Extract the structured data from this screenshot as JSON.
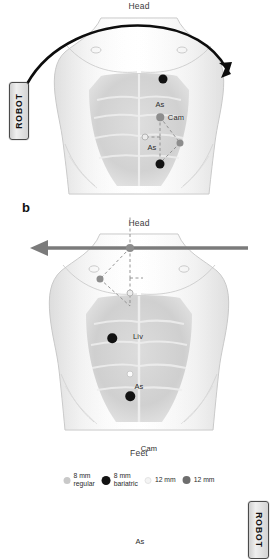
{
  "figure": {
    "panels": [
      {
        "id": "a",
        "letter": "",
        "orientation_top": "Head",
        "robot_label": "ROBOT",
        "robot_side": "left",
        "arrow": "curved-arrow-down-right",
        "ports": [
          {
            "name": "assistant-upper-right",
            "label": "",
            "type": "8 mm bariatric",
            "color": "#121212"
          },
          {
            "name": "arm-upper",
            "label": "As",
            "type": "8 mm regular",
            "color": "#8d8d8d"
          },
          {
            "name": "camera",
            "label": "Cam",
            "type": "12 mm",
            "color": "#8d8d8d"
          },
          {
            "name": "arm-lower",
            "label": "As",
            "type": "8 mm regular",
            "color": "#ececec"
          },
          {
            "name": "arm-lateral",
            "label": "",
            "type": "8 mm regular",
            "color": "#8d8d8d"
          },
          {
            "name": "assistant-lower",
            "label": "",
            "type": "8 mm bariatric",
            "color": "#121212"
          }
        ]
      },
      {
        "id": "b",
        "letter": "b",
        "orientation_top": "Head",
        "robot_label": "ROBOT",
        "robot_side": "right",
        "arrow": "straight-arrow-left",
        "ports": [
          {
            "name": "assistant-upper-left",
            "label": "",
            "type": "8 mm bariatric",
            "color": "#121212"
          },
          {
            "name": "liver-retractor",
            "label": "Liv",
            "type": "8 mm regular",
            "color": "#fbfbfb"
          },
          {
            "name": "arm-upper",
            "label": "As",
            "type": "8 mm regular",
            "color": "#fbfbfb"
          },
          {
            "name": "camera",
            "label": "Cam",
            "type": "12 mm",
            "color": "#6e6e6e"
          },
          {
            "name": "arm-lower",
            "label": "As",
            "type": "8 mm regular",
            "color": "#ececec"
          },
          {
            "name": "arm-lateral",
            "label": "",
            "type": "8 mm regular",
            "color": "#8d8d8d"
          },
          {
            "name": "assistant-lower",
            "label": "",
            "type": "8 mm bariatric",
            "color": "#121212"
          }
        ]
      }
    ],
    "orientation_bottom": "Feet",
    "legend": {
      "items": [
        {
          "swatch": "#c9c9c9",
          "size": 7,
          "line1": "8 mm",
          "line2": "regular"
        },
        {
          "swatch": "#121212",
          "size": 9,
          "line1": "8 mm",
          "line2": "bariatric"
        },
        {
          "swatch": "#f4f4f4",
          "size": 7,
          "line1": "12 mm",
          "line2": ""
        },
        {
          "swatch": "#6e6e6e",
          "size": 8,
          "line1": "12 mm",
          "line2": ""
        }
      ]
    }
  }
}
